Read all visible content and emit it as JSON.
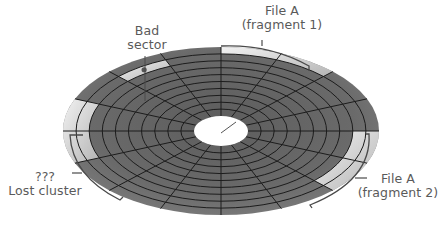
{
  "diagram": {
    "disk": {
      "center": [
        221,
        131
      ],
      "outer_rx": 158,
      "outer_ry": 84,
      "hub_rx": 27,
      "hub_ry": 15,
      "tracks": 10,
      "sectors": 16,
      "colors": {
        "platter": "#6f6f6f",
        "platter_light": "#8a8a8a",
        "grid": "#1c1c1c",
        "hub": "#ffffff",
        "highlight_light": "#ececec",
        "highlight_mid": "#bdbdbd",
        "bracket": "#4a4a4a",
        "label": "#5a5a5a"
      }
    },
    "regions": [
      {
        "name": "file-a-fragment-1",
        "start_deg": 270,
        "end_deg": 315,
        "track_from": 9,
        "track_to": 10
      },
      {
        "name": "file-a-fragment-2",
        "start_deg": 0,
        "end_deg": 45,
        "track_from": 8,
        "track_to": 10
      },
      {
        "name": "lost-cluster",
        "start_deg": 157.5,
        "end_deg": 202.5,
        "track_from": 8,
        "track_to": 10
      },
      {
        "name": "bad-sector",
        "start_deg": 225,
        "end_deg": 247.5,
        "track_from": 8,
        "track_to": 9
      }
    ],
    "labels": {
      "bad_sector": {
        "line1": "Bad",
        "line2": "sector"
      },
      "fragment1": {
        "line1": "File A",
        "line2": "(fragment 1)"
      },
      "fragment2": {
        "line1": "File A",
        "line2": "(fragment 2)"
      },
      "lost_cluster": {
        "line1": "???",
        "line2": "Lost cluster"
      }
    }
  }
}
